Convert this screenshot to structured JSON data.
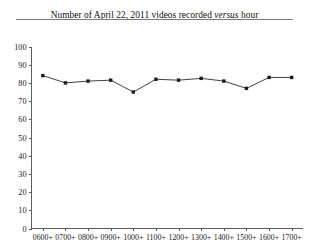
{
  "figure": {
    "title_prefix": "Number of April 22, 2011 videos recorded ",
    "title_italic": "versus",
    "title_suffix": " hour",
    "title_full": "Number of April 22, 2011 videos recorded versus hour",
    "rule_color": "#7a7a7a",
    "background": "#ffffff"
  },
  "chart_data": {
    "type": "line",
    "title": "Number of April 22, 2011 videos recorded versus hour",
    "xlabel": "",
    "ylabel": "",
    "categories": [
      "0600+",
      "0700+",
      "0800+",
      "0900+",
      "1000+",
      "1100+",
      "1200+",
      "1300+",
      "1400+",
      "1500+",
      "1600+",
      "1700+"
    ],
    "values": [
      84,
      80,
      81,
      81.5,
      75,
      82,
      81.5,
      82.5,
      81,
      77,
      83,
      83
    ],
    "ylim": [
      0,
      100
    ],
    "yticks": [
      0,
      10,
      20,
      30,
      40,
      50,
      60,
      70,
      80,
      90,
      100
    ],
    "ytick_labels": [
      "0",
      "10",
      "20",
      "30",
      "40",
      "50",
      "60",
      "70",
      "80",
      "90",
      "100"
    ],
    "grid": false,
    "legend": false,
    "legend_position": "none",
    "marker": "square",
    "line_color": "#2b2b2b",
    "marker_color": "#1c1c1c"
  }
}
